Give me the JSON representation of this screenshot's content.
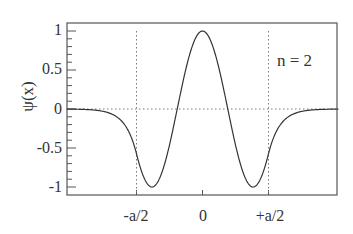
{
  "chart_data": {
    "type": "line",
    "title": "",
    "annotation": "n = 2",
    "xlabel": "",
    "ylabel": "ψ(x)",
    "x_tick_labels": [
      "-a/2",
      "0",
      "+a/2"
    ],
    "x_tick_positions": [
      -0.5,
      0,
      0.5
    ],
    "y_tick_labels": [
      "1",
      "0.5",
      "0",
      "-0.5",
      "-1"
    ],
    "y_tick_values": [
      1,
      0.5,
      0,
      -0.5,
      -1
    ],
    "xlim": [
      -1.03,
      1.03
    ],
    "ylim": [
      -1.1,
      1.1
    ],
    "grid": false,
    "reference_lines": {
      "vertical_dotted_at": [
        -0.5,
        0.5
      ],
      "horizontal_dotted_at": [
        0
      ]
    },
    "series": [
      {
        "name": "psi_n2",
        "description": "Finite square well wavefunction, n = 2 (even state with two nodes)",
        "x": [
          -1.03,
          -0.9,
          -0.8,
          -0.7,
          -0.6,
          -0.5,
          -0.45,
          -0.4,
          -0.35,
          -0.3,
          -0.25,
          -0.2,
          -0.15,
          -0.1,
          -0.05,
          0,
          0.05,
          0.1,
          0.15,
          0.2,
          0.25,
          0.3,
          0.35,
          0.4,
          0.45,
          0.5,
          0.6,
          0.7,
          0.8,
          0.9,
          1.03
        ],
        "y": [
          0.0,
          -0.003,
          -0.01,
          -0.04,
          -0.15,
          -0.5,
          -0.8,
          -1.0,
          -0.88,
          -0.55,
          -0.1,
          0.33,
          0.7,
          0.92,
          1.0,
          1.0,
          1.0,
          0.92,
          0.7,
          0.33,
          -0.1,
          -0.55,
          -0.88,
          -1.0,
          -0.8,
          -0.5,
          -0.15,
          -0.04,
          -0.01,
          -0.003,
          0.0
        ]
      }
    ]
  },
  "labels": {
    "ylabel": "ψ(x)",
    "annotation": "n = 2",
    "yticks": [
      "1",
      "0.5",
      "0",
      "-0.5",
      "-1"
    ],
    "xticks": [
      "-a/2",
      "0",
      "+a/2"
    ]
  },
  "colors": {
    "curve": "#333333",
    "frame": "#555555",
    "dotted": "#777777",
    "text": "#333333"
  }
}
